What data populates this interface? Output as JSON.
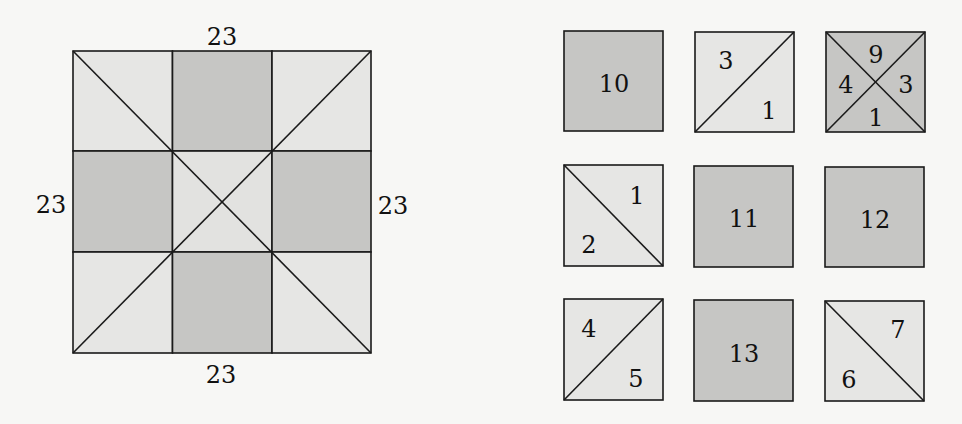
{
  "colors": {
    "background": "#f7f7f5",
    "light": "#e6e6e4",
    "dark": "#c6c6c4",
    "stroke": "#1a1a1a"
  },
  "big_square": {
    "labels": {
      "top": "23",
      "left": "23",
      "right": "23",
      "bottom": "23"
    },
    "grid": "3x3",
    "cells": [
      {
        "row": 0,
        "col": 0,
        "shade": "light",
        "diagonal": "tl-br"
      },
      {
        "row": 0,
        "col": 1,
        "shade": "dark"
      },
      {
        "row": 0,
        "col": 2,
        "shade": "light",
        "diagonal": "bl-tr"
      },
      {
        "row": 1,
        "col": 0,
        "shade": "dark"
      },
      {
        "row": 1,
        "col": 1,
        "shade": "light",
        "diagonal": "both"
      },
      {
        "row": 1,
        "col": 2,
        "shade": "dark"
      },
      {
        "row": 2,
        "col": 0,
        "shade": "light",
        "diagonal": "bl-tr"
      },
      {
        "row": 2,
        "col": 1,
        "shade": "dark"
      },
      {
        "row": 2,
        "col": 2,
        "shade": "light",
        "diagonal": "tl-br"
      }
    ]
  },
  "tiles": [
    {
      "id": "tile-10",
      "shade": "dark",
      "labels": [
        "10"
      ]
    },
    {
      "id": "tile-3-1",
      "shade": "light",
      "diagonal": "bl-tr",
      "labels": [
        "3",
        "1"
      ]
    },
    {
      "id": "tile-9-4-3-1",
      "shade": "dark",
      "diagonal": "both",
      "labels": [
        "9",
        "4",
        "3",
        "1"
      ]
    },
    {
      "id": "tile-1-2",
      "shade": "light",
      "diagonal": "tl-br",
      "labels": [
        "1",
        "2"
      ]
    },
    {
      "id": "tile-11",
      "shade": "dark",
      "labels": [
        "11"
      ]
    },
    {
      "id": "tile-12",
      "shade": "dark",
      "labels": [
        "12"
      ]
    },
    {
      "id": "tile-4-5",
      "shade": "light",
      "diagonal": "bl-tr",
      "labels": [
        "4",
        "5"
      ]
    },
    {
      "id": "tile-13",
      "shade": "dark",
      "labels": [
        "13"
      ]
    },
    {
      "id": "tile-7-6",
      "shade": "light",
      "diagonal": "tl-br",
      "labels": [
        "7",
        "6"
      ]
    }
  ]
}
